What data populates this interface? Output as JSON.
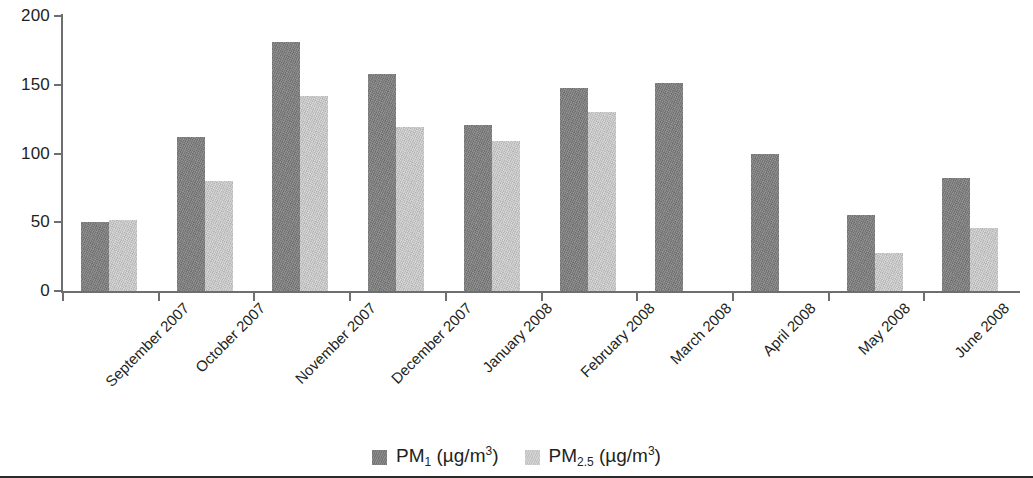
{
  "chart_data": {
    "type": "bar",
    "title": "",
    "xlabel": "",
    "ylabel": "",
    "ylim": [
      0,
      200
    ],
    "ytick_labels": [
      "200",
      "150",
      "100",
      "50",
      "0"
    ],
    "ytick_values": [
      200,
      150,
      100,
      50,
      0
    ],
    "grid": false,
    "legend_position": "bottom-center",
    "categories": [
      "September 2007",
      "October 2007",
      "November 2007",
      "December 2007",
      "January 2008",
      "February 2008",
      "March 2008",
      "April 2008",
      "May 2008",
      "June 2008"
    ],
    "series": [
      {
        "name": "PM1 (µg/m3)",
        "label_main": "PM",
        "label_sub": "1",
        "label_unit": "(µg/m",
        "label_sup": "3",
        "label_tail": ")",
        "color": "#7f7f7f",
        "values": [
          50,
          112,
          181,
          158,
          121,
          148,
          151,
          100,
          55,
          82
        ]
      },
      {
        "name": "PM2.5 (µg/m3)",
        "label_main": "PM",
        "label_sub": "2.5",
        "label_unit": "(µg/m",
        "label_sup": "3",
        "label_tail": ")",
        "color": "#c9c9c9",
        "values": [
          52,
          80,
          142,
          119,
          109,
          130,
          null,
          null,
          28,
          46
        ]
      }
    ]
  },
  "legend": {
    "items": [
      {
        "series_index": 0,
        "swatch": "dark"
      },
      {
        "series_index": 1,
        "swatch": "light"
      }
    ]
  }
}
